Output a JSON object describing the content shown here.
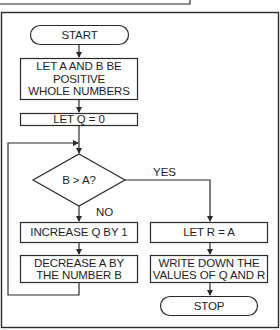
{
  "flowchart": {
    "nodes": {
      "start": {
        "label": "START",
        "shape": "terminal"
      },
      "init": {
        "lines": [
          "LET A AND B BE",
          "POSITIVE",
          "WHOLE NUMBERS"
        ],
        "shape": "process"
      },
      "setq": {
        "label": "LET Q = 0",
        "shape": "process"
      },
      "decision": {
        "label": "B > A?",
        "shape": "decision"
      },
      "incq": {
        "label": "INCREASE Q BY 1",
        "shape": "process"
      },
      "deca": {
        "lines": [
          "DECREASE A BY",
          "THE NUMBER B"
        ],
        "shape": "process"
      },
      "setr": {
        "label": "LET R = A",
        "shape": "process"
      },
      "write": {
        "lines": [
          "WRITE DOWN THE",
          "VALUES OF Q AND R"
        ],
        "shape": "process"
      },
      "stop": {
        "label": "STOP",
        "shape": "terminal"
      }
    },
    "edges": {
      "yes_label": "YES",
      "no_label": "NO"
    },
    "colors": {
      "stroke": "#2a2a2a",
      "text": "#1e1e1e",
      "background": "#ffffff"
    }
  }
}
